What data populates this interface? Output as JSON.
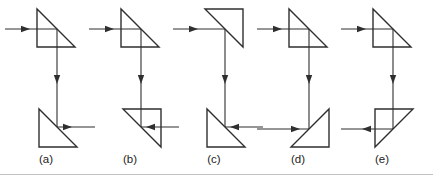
{
  "figure": {
    "background_color": "#ffffff",
    "line_color": "#2f2f2f",
    "label_color": "#222222",
    "panels": [
      {
        "label": "(a)",
        "top_prism_orientation": "right-angle-bottom-left",
        "bottom_prism_orientation": "right-angle-bottom-left",
        "input_arrow_direction": "right",
        "middle_arrow_direction": "down",
        "output_side": "right",
        "output_arrow_direction": "right"
      },
      {
        "label": "(b)",
        "top_prism_orientation": "right-angle-bottom-left",
        "bottom_prism_orientation": "right-angle-top-right",
        "input_arrow_direction": "right",
        "middle_arrow_direction": "down",
        "output_side": "right",
        "output_arrow_direction": "left"
      },
      {
        "label": "(c)",
        "top_prism_orientation": "right-angle-top-right",
        "bottom_prism_orientation": "right-angle-bottom-left",
        "input_arrow_direction": "right",
        "middle_arrow_direction": "down",
        "output_side": "right",
        "output_arrow_direction": "left"
      },
      {
        "label": "(d)",
        "top_prism_orientation": "right-angle-bottom-left",
        "bottom_prism_orientation": "right-angle-bottom-right",
        "input_arrow_direction": "right",
        "middle_arrow_direction": "down",
        "output_side": "left",
        "output_arrow_direction": "right"
      },
      {
        "label": "(e)",
        "top_prism_orientation": "right-angle-bottom-left",
        "bottom_prism_orientation": "right-angle-top-left",
        "input_arrow_direction": "right",
        "middle_arrow_direction": "down",
        "output_side": "left",
        "output_arrow_direction": "left"
      }
    ]
  }
}
